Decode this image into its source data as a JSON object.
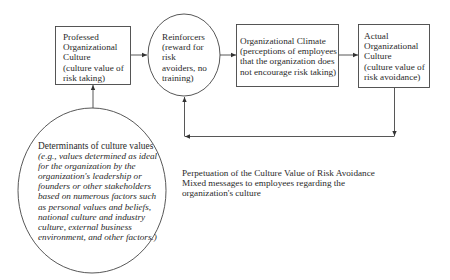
{
  "diagram": {
    "nodes": [
      {
        "id": "professed",
        "shape": "rectangle",
        "lines": [
          "Professed",
          "Organizational",
          "Culture",
          "(culture value of",
          "risk taking)"
        ]
      },
      {
        "id": "reinforcers",
        "shape": "circle",
        "lines": [
          "Reinforcers",
          "(reward for",
          "risk",
          "avoiders, no",
          "training)"
        ]
      },
      {
        "id": "climate",
        "shape": "rectangle",
        "lines": [
          "Organizational Climate",
          "(perceptions of employees",
          "that the organization does",
          "not encourage risk taking)"
        ]
      },
      {
        "id": "actual",
        "shape": "rectangle",
        "lines": [
          "Actual",
          "Organizational",
          "Culture",
          "(culture value of",
          "risk avoidance)"
        ]
      },
      {
        "id": "determinants",
        "shape": "circle",
        "title": "Determinants of culture values",
        "lines": [
          "(e.g., values determined as ideal",
          "for the organization by the",
          "organization's leadership or",
          "founders or other stakeholders",
          "based on numerous factors such",
          "as personal values and beliefs,",
          "national culture and industry",
          "culture, external business",
          "environment, and other factors.)"
        ]
      }
    ],
    "edges": [
      {
        "from": "determinants",
        "to": "professed"
      },
      {
        "from": "professed",
        "to": "reinforcers"
      },
      {
        "from": "reinforcers",
        "to": "climate"
      },
      {
        "from": "climate",
        "to": "actual"
      },
      {
        "from": "actual",
        "to": "reinforcers",
        "route": "feedback loop below"
      }
    ],
    "caption": {
      "lines": [
        "Perpetuation of the Culture Value of Risk Avoidance",
        "Mixed messages to employees regarding the",
        "organization's culture"
      ]
    }
  }
}
